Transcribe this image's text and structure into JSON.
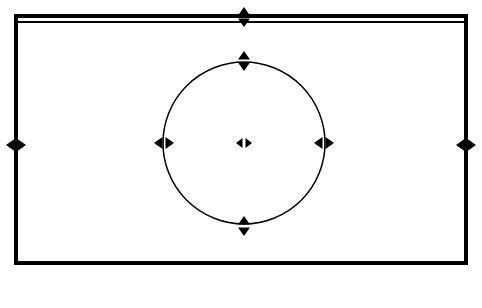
{
  "document": {
    "title": "Shape selection diagram",
    "background_color": "#ffffff",
    "stroke_color": "#000000",
    "canvas": {
      "width": 482,
      "height": 308
    }
  },
  "shapes": {
    "rectangle": {
      "name": "selected-rectangle",
      "x": 14,
      "y": 14,
      "width": 454,
      "height": 251,
      "stroke_width": 4,
      "has_double_top_edge": true,
      "top_inner_line_offset": 7,
      "top_inner_line_width": 2
    },
    "circle": {
      "name": "selected-circle",
      "center_x": 244,
      "center_y": 143,
      "radius": 81,
      "stroke_width": 1.4
    }
  },
  "handles": [
    {
      "id": "rect-left-handle",
      "label": "Left edge handle",
      "x": 14,
      "y": 145,
      "direction": "horizontal"
    },
    {
      "id": "rect-right-handle",
      "label": "Right edge handle",
      "x": 468,
      "y": 145,
      "direction": "horizontal"
    },
    {
      "id": "rect-top-handle",
      "label": "Top edge handle",
      "x": 244,
      "y": 17,
      "direction": "vertical"
    },
    {
      "id": "circle-left-handle",
      "label": "Circle left handle",
      "x": 164,
      "y": 143,
      "direction": "horizontal"
    },
    {
      "id": "circle-right-handle",
      "label": "Circle right handle",
      "x": 324,
      "y": 143,
      "direction": "horizontal"
    },
    {
      "id": "circle-top-handle",
      "label": "Circle top handle",
      "x": 244,
      "y": 61,
      "direction": "vertical"
    },
    {
      "id": "circle-bottom-handle",
      "label": "Circle bottom handle",
      "x": 244,
      "y": 226,
      "direction": "vertical"
    },
    {
      "id": "circle-center-handle",
      "label": "Circle center handle",
      "x": 244,
      "y": 143,
      "direction": "horizontal"
    }
  ],
  "legend": {
    "vertical_symbol": "⇕",
    "vertical_symbol_name": "up-down-double-arrow-icon",
    "horizontal_symbol": "⇆",
    "horizontal_symbol_name": "left-right-double-arrow-icon"
  }
}
